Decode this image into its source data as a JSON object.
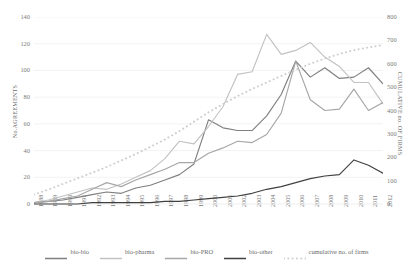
{
  "chart_data": {
    "type": "line",
    "title": "",
    "xlabel": "",
    "ylabel": "No.AGREEMENTS",
    "y2label": "CUMULATIVE no. OF FIRMS",
    "grid": true,
    "legend_position": "bottom",
    "ylim": [
      0,
      140
    ],
    "y2lim": [
      0,
      800
    ],
    "yticks": [
      0,
      20,
      40,
      60,
      80,
      100,
      120,
      140
    ],
    "y2ticks": [
      0,
      100,
      200,
      300,
      400,
      500,
      600,
      700,
      800
    ],
    "categories": [
      "1988",
      "1989",
      "1990",
      "1991",
      "1992",
      "1993",
      "1994",
      "1995",
      "1996",
      "1997",
      "1998",
      "1999",
      "2000",
      "2001",
      "2002",
      "2003",
      "2004",
      "2005",
      "2006",
      "2007",
      "2008",
      "2009",
      "2010",
      "2011",
      "2012"
    ],
    "series": [
      {
        "name": "bio-bio",
        "axis": "left",
        "color": "#7f7f7f",
        "style": "solid",
        "values": [
          1,
          2,
          3,
          5,
          7,
          9,
          8,
          12,
          14,
          18,
          22,
          30,
          63,
          57,
          55,
          55,
          66,
          82,
          107,
          95,
          102,
          94,
          95,
          102,
          90
        ]
      },
      {
        "name": "bio-pharma",
        "axis": "left",
        "color": "#c2c2c2",
        "style": "solid",
        "values": [
          1,
          3,
          6,
          9,
          12,
          11,
          15,
          20,
          25,
          34,
          47,
          45,
          58,
          73,
          97,
          99,
          127,
          112,
          115,
          121,
          110,
          103,
          91,
          91,
          75
        ]
      },
      {
        "name": "bio-PRO",
        "axis": "left",
        "color": "#a6a6a6",
        "style": "solid",
        "values": [
          1,
          2,
          4,
          6,
          11,
          16,
          13,
          18,
          22,
          26,
          31,
          31,
          38,
          42,
          47,
          46,
          52,
          68,
          107,
          78,
          70,
          71,
          86,
          70,
          76
        ]
      },
      {
        "name": "bio-other",
        "axis": "left",
        "color": "#404040",
        "style": "solid",
        "values": [
          0,
          0,
          0,
          0,
          1,
          1,
          1,
          1,
          1,
          2,
          2,
          3,
          4,
          5,
          6,
          8,
          11,
          13,
          16,
          19,
          21,
          22,
          33,
          29,
          23
        ]
      },
      {
        "name": "cumulative no. of firms",
        "axis": "right",
        "color": "#cfcfcf",
        "style": "dotted",
        "values": [
          40,
          62,
          86,
          110,
          134,
          158,
          186,
          214,
          244,
          276,
          312,
          352,
          392,
          428,
          462,
          492,
          520,
          548,
          574,
          600,
          622,
          642,
          658,
          670,
          680
        ]
      }
    ]
  },
  "legend": {
    "items": [
      {
        "label": "bio-bio"
      },
      {
        "label": "bio-pharma"
      },
      {
        "label": "bio-PRO"
      },
      {
        "label": "bio-other"
      },
      {
        "label": "cumulative no. of firms"
      }
    ]
  }
}
